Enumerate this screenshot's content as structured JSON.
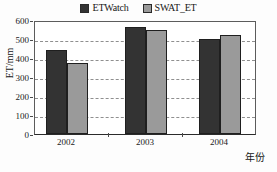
{
  "chart_data": {
    "type": "bar",
    "title": "",
    "xlabel": "年份",
    "ylabel": "ET/mm",
    "categories": [
      "2002",
      "2003",
      "2004"
    ],
    "series": [
      {
        "name": "ETWatch",
        "color": "#333333",
        "values": [
          440,
          565,
          500
        ]
      },
      {
        "name": "SWAT_ET",
        "color": "#9a9a9a",
        "values": [
          375,
          548,
          523
        ]
      }
    ],
    "ylim": [
      0,
      600
    ],
    "ytick_values": [
      0,
      100,
      200,
      300,
      400,
      500,
      600
    ],
    "ytick_labels": [
      "0",
      "100",
      "200",
      "300",
      "400",
      "500",
      "600"
    ],
    "grid": "horizontal-dashed",
    "legend_position": "top-center"
  },
  "legend": {
    "entries": [
      {
        "label": "ETWatch",
        "swatch_color": "#333333"
      },
      {
        "label": "SWAT_ET",
        "swatch_color": "#9a9a9a"
      }
    ]
  },
  "axes": {
    "y_title": "ET/mm",
    "x_title": "年份",
    "y_labels": [
      "600",
      "500",
      "400",
      "300",
      "200",
      "100",
      "0"
    ],
    "x_labels": [
      "2002",
      "2003",
      "2004"
    ]
  },
  "colors": {
    "series_dark": "#333333",
    "series_gray": "#9a9a9a",
    "gridline": "#8f8f8f",
    "frame": "#5c5c5c",
    "text": "#1b1b1b",
    "background": "#fdfdfd"
  }
}
